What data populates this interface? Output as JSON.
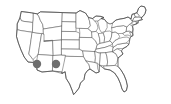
{
  "figure": {
    "type": "map",
    "region": "Contiguous United States",
    "width_px": 171,
    "height_px": 104,
    "background_color": "#ffffff",
    "border_color": "#5a5a5a",
    "outline_color": "#4a4a4a",
    "state_fill_color": "#ffffff"
  },
  "markers": {
    "count": 2,
    "shape": "circle",
    "fill_color": "#6e6e6e",
    "radius_px": 4.2,
    "items": [
      {
        "label": "Arizona",
        "state_code": "AZ",
        "x": 37,
        "y": 64
      },
      {
        "label": "New Mexico",
        "state_code": "NM",
        "x": 56,
        "y": 64
      }
    ]
  },
  "legend": {
    "visible": false,
    "entries": []
  },
  "labels": {
    "visible": false,
    "entries": []
  },
  "accessibility": {
    "alt_text": "Black and white outline map of the contiguous United States showing state boundaries, with two gray filled dots marking locations in Arizona and New Mexico."
  }
}
